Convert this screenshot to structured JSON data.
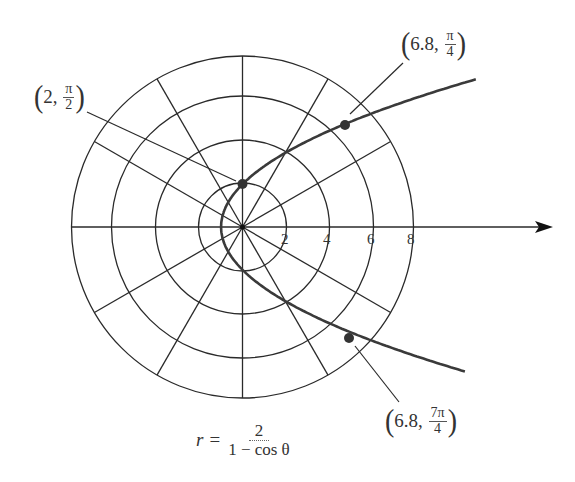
{
  "title": "",
  "equation": {
    "lhs": "r",
    "eq": "=",
    "numerator": "2",
    "denominator": "1 − cos θ"
  },
  "axis": {
    "tick_labels": [
      "2",
      "4",
      "6",
      "8"
    ]
  },
  "points": [
    {
      "label_r": "2",
      "label_num": "π",
      "label_den": "2",
      "r": 2,
      "theta": "π/2"
    },
    {
      "label_r": "6.8",
      "label_num": "π",
      "label_den": "4",
      "r": 6.8,
      "theta": "π/4"
    },
    {
      "label_r": "6.8",
      "label_num": "7π",
      "label_den": "4",
      "r": 6.8,
      "theta": "7π/4"
    }
  ],
  "chart_data": {
    "type": "polar-plot",
    "curve": "parabola r = 2/(1 − cos θ)",
    "radial_grid": [
      2,
      4,
      6,
      8
    ],
    "angular_grid_deg": [
      0,
      30,
      60,
      90,
      120,
      150,
      180,
      210,
      240,
      270,
      300,
      330
    ],
    "polar_axis_tick_labels": [
      "2",
      "4",
      "6",
      "8"
    ],
    "labeled_points": [
      {
        "r": 2,
        "theta": "π/2",
        "label": "(2, π/2)"
      },
      {
        "r": 6.8,
        "theta": "π/4",
        "label": "(6.8, π/4)"
      },
      {
        "r": 6.8,
        "theta": "7π/4",
        "label": "(6.8, 7π/4)"
      }
    ]
  },
  "colors": {
    "grid": "#2a2a2a",
    "curve": "#3a3a3a",
    "point": "#333333",
    "text": "#333333"
  }
}
